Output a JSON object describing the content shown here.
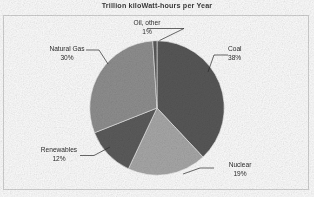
{
  "chart_data": {
    "type": "pie",
    "title": "Trillion kiloWatt-hours per Year",
    "xlabel": "",
    "ylabel": "",
    "grid": false,
    "legend": "none",
    "labels_position": "outside-with-leader-lines",
    "start_angle_deg": 0,
    "direction": "clockwise",
    "categories": [
      "Coal",
      "Nuclear",
      "Renewables",
      "Natural Gas",
      "Oil, other"
    ],
    "values": [
      38,
      19,
      12,
      30,
      1
    ],
    "value_suffix": "%",
    "slices": [
      {
        "name": "Coal",
        "value": 38,
        "value_label": "38%",
        "color": "#585858",
        "start_deg": 0.0,
        "end_deg": 136.8
      },
      {
        "name": "Nuclear",
        "value": 19,
        "value_label": "19%",
        "color": "#a9a9a9",
        "start_deg": 136.8,
        "end_deg": 205.2
      },
      {
        "name": "Renewables",
        "value": 12,
        "value_label": "12%",
        "color": "#5c5c5c",
        "start_deg": 205.2,
        "end_deg": 248.4
      },
      {
        "name": "Natural Gas",
        "value": 30,
        "value_label": "30%",
        "color": "#909090",
        "start_deg": 248.4,
        "end_deg": 356.4
      },
      {
        "name": "Oil, other",
        "value": 1,
        "value_label": "1%",
        "color": "#5a5a5a",
        "start_deg": 356.4,
        "end_deg": 360.0
      }
    ]
  },
  "title": {
    "text": "Trillion kiloWatt-hours per Year"
  },
  "labels": {
    "oil": {
      "name": "Oil, other",
      "value": "1%"
    },
    "coal": {
      "name": "Coal",
      "value": "38%"
    },
    "gas": {
      "name": "Natural Gas",
      "value": "30%"
    },
    "renewables": {
      "name": "Renewables",
      "value": "12%"
    },
    "nuclear": {
      "name": "Nuclear",
      "value": "19%"
    }
  },
  "colors": {
    "plot_border": "#d2d2d2",
    "plot_background": "#ffffff",
    "text": "#2e2e2e",
    "title_text": "#3d3d3d",
    "leader_line": "#2b2b2b"
  }
}
